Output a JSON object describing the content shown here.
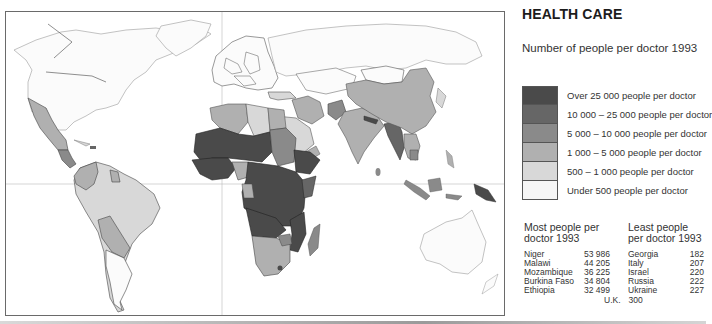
{
  "header": {
    "title": "HEALTH CARE",
    "subtitle": "Number of people per doctor 1993"
  },
  "legend": {
    "items": [
      {
        "label": "Over 25 000 people per doctor",
        "color": "#4a4a4a"
      },
      {
        "label": "10 000 – 25 000 people per doctor",
        "color": "#666666"
      },
      {
        "label": "5 000 – 10 000 people per doctor",
        "color": "#8a8a8a"
      },
      {
        "label": "1 000 – 5 000 people per doctor",
        "color": "#b0b0b0"
      },
      {
        "label": "500 – 1 000 people per doctor",
        "color": "#d8d8d8"
      },
      {
        "label": "Under 500 people per doctor",
        "color": "#f6f6f6"
      }
    ]
  },
  "most": {
    "heading": "Most people per doctor 1993",
    "rows": [
      {
        "country": "Niger",
        "value": "53 986"
      },
      {
        "country": "Malawi",
        "value": "44 205"
      },
      {
        "country": "Mozambique",
        "value": "36 225"
      },
      {
        "country": "Burkina Faso",
        "value": "34 804"
      },
      {
        "country": "Ethiopia",
        "value": "32 499"
      }
    ]
  },
  "least": {
    "heading": "Least people per doctor 1993",
    "rows": [
      {
        "country": "Georgia",
        "value": "182"
      },
      {
        "country": "Italy",
        "value": "207"
      },
      {
        "country": "Israel",
        "value": "220"
      },
      {
        "country": "Russia",
        "value": "222"
      },
      {
        "country": "Ukraine",
        "value": "227"
      }
    ]
  },
  "uk": {
    "label": "U.K.",
    "value": "300"
  },
  "map": {
    "colors": {
      "c1": "#4a4a4a",
      "c2": "#666666",
      "c3": "#8a8a8a",
      "c4": "#b0b0b0",
      "c5": "#d8d8d8",
      "c6": "#f6f6f6",
      "outline": "#444444",
      "light_outline": "#9a9a9a"
    }
  }
}
